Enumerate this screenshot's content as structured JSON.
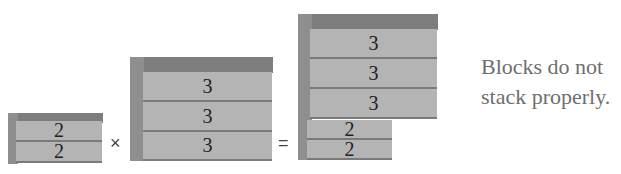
{
  "diagram": {
    "left_stack": {
      "blocks": [
        "2",
        "2"
      ]
    },
    "middle_stack": {
      "blocks": [
        "3",
        "3",
        "3"
      ]
    },
    "result_stack": {
      "blocks_top": [
        "3",
        "3",
        "3"
      ],
      "blocks_bottom": [
        "2",
        "2"
      ]
    },
    "operators": {
      "multiply": "×",
      "equals": "="
    },
    "caption": {
      "line1": "Blocks do not",
      "line2": "stack properly."
    }
  }
}
